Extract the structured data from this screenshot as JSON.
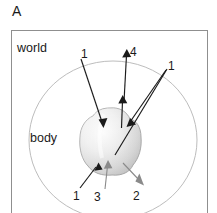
{
  "figure": {
    "panel_letter": "A",
    "type": "schematic-diagram",
    "background_color": "#ffffff",
    "frame": {
      "name": "world-frame",
      "shape": "rectangle",
      "border_color": "#8f8f8f",
      "x": 11,
      "y": 30,
      "width": 197,
      "height": 183
    },
    "regions": [
      {
        "id": "world",
        "label": "world",
        "label_x": 17,
        "label_y": 47,
        "shape": "rectangle-frame"
      },
      {
        "id": "body",
        "label": "body",
        "label_x": 30,
        "label_y": 137,
        "shape": "ellipse",
        "ellipse": {
          "cx": 113,
          "cy": 140,
          "rx": 84,
          "ry": 78
        },
        "stroke_color": "#b5b5b5"
      }
    ],
    "center_blob": {
      "id": "agent-blob",
      "shape": "lobed-sphere",
      "cx": 110,
      "cy": 140,
      "rx": 30,
      "ry": 32,
      "fill_light": "#f2f2f2",
      "fill_mid": "#d9d9d9",
      "fill_dark": "#bcbcbc",
      "stroke_color": "#9a9a9a"
    },
    "arrows": [
      {
        "id": "arrow-1-upper-left",
        "label": "1",
        "label_x": 85,
        "label_y": 54,
        "color": "#1a1a1a",
        "from_x": 81,
        "from_y": 58,
        "to_x": 103,
        "to_y": 126,
        "head": "filled-triangle",
        "direction": "inward"
      },
      {
        "id": "arrow-4-up",
        "label": "4",
        "label_x": 133,
        "label_y": 52,
        "color": "#1a1a1a",
        "from_x": 124,
        "from_y": 100,
        "to_x": 127,
        "to_y": 50,
        "head": "filled-triangle",
        "direction": "outward"
      },
      {
        "id": "arrow-4-stub-up",
        "label": "",
        "color": "#1a1a1a",
        "from_x": 122,
        "from_y": 128,
        "to_x": 123,
        "to_y": 96,
        "head": "filled-triangle",
        "direction": "outward"
      },
      {
        "id": "arrow-1-upper-right",
        "label": "1",
        "label_x": 170,
        "label_y": 65,
        "color": "#1a1a1a",
        "from_x": 167,
        "from_y": 68,
        "to_x": 126,
        "to_y": 127,
        "head": "filled-triangle",
        "direction": "inward"
      },
      {
        "id": "arrow-1-lower-left",
        "label": "1",
        "label_x": 74,
        "label_y": 197,
        "color": "#1a1a1a",
        "from_x": 80,
        "from_y": 188,
        "to_x": 98,
        "to_y": 163,
        "head": "filled-triangle",
        "direction": "inward"
      },
      {
        "id": "arrow-3-up",
        "label": "3",
        "label_x": 95,
        "label_y": 198,
        "color": "#8a8a8a",
        "from_x": 105,
        "from_y": 189,
        "to_x": 108,
        "to_y": 161,
        "head": "filled-triangle",
        "direction": "inward"
      },
      {
        "id": "arrow-2-down-right",
        "label": "2",
        "label_x": 135,
        "label_y": 198,
        "color": "#8a8a8a",
        "from_x": 123,
        "from_y": 163,
        "to_x": 143,
        "to_y": 184,
        "head": "filled-triangle",
        "direction": "outward"
      },
      {
        "id": "center-line-long",
        "label": "",
        "color": "#1a1a1a",
        "from_x": 116,
        "from_y": 152,
        "to_x": 167,
        "to_y": 68,
        "head": "none",
        "direction": "line"
      }
    ]
  }
}
